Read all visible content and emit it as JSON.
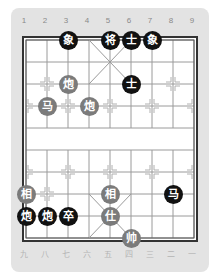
{
  "board": {
    "columns": 9,
    "rows": 10,
    "origin_x": 26,
    "origin_y": 40,
    "col_spacing": 21,
    "row_spacing": 22,
    "colors": {
      "card_background": "#e3e3e3",
      "board_background": "#ffffff",
      "grid_line": "#9a9a9a",
      "frame_line": "#333333",
      "black_piece": "#111111",
      "red_piece": "#7b7b7b",
      "piece_text": "#ffffff"
    }
  },
  "top_labels": [
    "1",
    "2",
    "3",
    "4",
    "5",
    "6",
    "7",
    "8",
    "9"
  ],
  "bottom_labels": [
    "九",
    "八",
    "七",
    "六",
    "五",
    "四",
    "三",
    "二",
    "一"
  ],
  "pieces": [
    {
      "side": "black",
      "char": "象",
      "name": "black-elephant",
      "col": 2,
      "row": 0
    },
    {
      "side": "black",
      "char": "将",
      "name": "black-general",
      "col": 4,
      "row": 0
    },
    {
      "side": "black",
      "char": "士",
      "name": "black-advisor",
      "col": 5,
      "row": 0
    },
    {
      "side": "black",
      "char": "象",
      "name": "black-elephant",
      "col": 6,
      "row": 0
    },
    {
      "side": "black",
      "char": "士",
      "name": "black-advisor",
      "col": 5,
      "row": 2
    },
    {
      "side": "red",
      "char": "炮",
      "name": "red-cannon",
      "col": 2,
      "row": 2
    },
    {
      "side": "red",
      "char": "马",
      "name": "red-horse",
      "col": 1,
      "row": 3
    },
    {
      "side": "red",
      "char": "炮",
      "name": "red-cannon",
      "col": 3,
      "row": 3
    },
    {
      "side": "red",
      "char": "相",
      "name": "red-elephant",
      "col": 0,
      "row": 7
    },
    {
      "side": "red",
      "char": "相",
      "name": "red-elephant",
      "col": 4,
      "row": 7
    },
    {
      "side": "black",
      "char": "马",
      "name": "black-horse",
      "col": 7,
      "row": 7
    },
    {
      "side": "black",
      "char": "炮",
      "name": "black-cannon",
      "col": 0,
      "row": 8
    },
    {
      "side": "black",
      "char": "炮",
      "name": "black-cannon",
      "col": 1,
      "row": 8
    },
    {
      "side": "black",
      "char": "卒",
      "name": "black-soldier",
      "col": 2,
      "row": 8
    },
    {
      "side": "red",
      "char": "仕",
      "name": "red-advisor",
      "col": 4,
      "row": 8
    },
    {
      "side": "red",
      "char": "帅",
      "name": "red-general",
      "col": 5,
      "row": 9
    }
  ],
  "position_marks": [
    {
      "col": 1,
      "row": 2
    },
    {
      "col": 7,
      "row": 2
    },
    {
      "col": 0,
      "row": 3
    },
    {
      "col": 2,
      "row": 3
    },
    {
      "col": 4,
      "row": 3
    },
    {
      "col": 6,
      "row": 3
    },
    {
      "col": 8,
      "row": 3
    },
    {
      "col": 0,
      "row": 6
    },
    {
      "col": 2,
      "row": 6
    },
    {
      "col": 4,
      "row": 6
    },
    {
      "col": 6,
      "row": 6
    },
    {
      "col": 8,
      "row": 6
    },
    {
      "col": 1,
      "row": 7
    },
    {
      "col": 7,
      "row": 7
    }
  ]
}
